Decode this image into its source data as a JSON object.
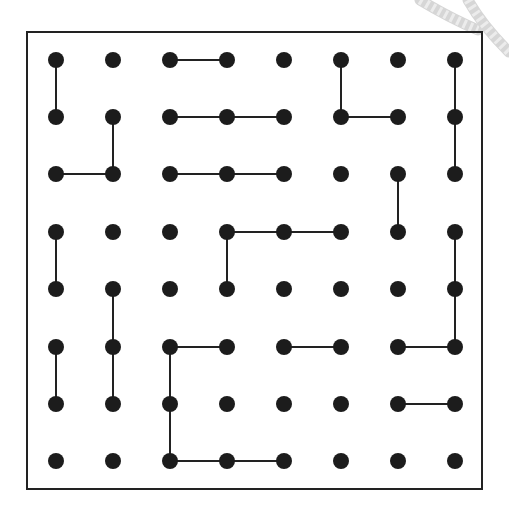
{
  "diagram": {
    "type": "dot-grid-maze",
    "grid": {
      "columns": 8,
      "rows": 8
    },
    "colors": {
      "dot": "#1c1c1c",
      "line": "#222222",
      "frame": "#222222",
      "background": "#ffffff",
      "rope": "#d6d6d6"
    },
    "frame": {
      "x": 27,
      "y": 32,
      "width": 455,
      "height": 457
    },
    "col_x": [
      56,
      113,
      170,
      227,
      284,
      341,
      398,
      455
    ],
    "row_y": [
      60,
      117,
      174,
      232,
      289,
      347,
      404,
      461
    ],
    "edges": [
      [
        [
          0,
          0
        ],
        [
          0,
          1
        ]
      ],
      [
        [
          2,
          0
        ],
        [
          3,
          0
        ]
      ],
      [
        [
          5,
          0
        ],
        [
          5,
          1
        ]
      ],
      [
        [
          5,
          1
        ],
        [
          6,
          1
        ]
      ],
      [
        [
          7,
          0
        ],
        [
          7,
          1
        ]
      ],
      [
        [
          7,
          1
        ],
        [
          7,
          2
        ]
      ],
      [
        [
          1,
          1
        ],
        [
          1,
          2
        ]
      ],
      [
        [
          0,
          2
        ],
        [
          1,
          2
        ]
      ],
      [
        [
          2,
          1
        ],
        [
          3,
          1
        ]
      ],
      [
        [
          3,
          1
        ],
        [
          4,
          1
        ]
      ],
      [
        [
          2,
          2
        ],
        [
          3,
          2
        ]
      ],
      [
        [
          3,
          2
        ],
        [
          4,
          2
        ]
      ],
      [
        [
          6,
          2
        ],
        [
          6,
          3
        ]
      ],
      [
        [
          3,
          3
        ],
        [
          4,
          3
        ]
      ],
      [
        [
          4,
          3
        ],
        [
          5,
          3
        ]
      ],
      [
        [
          3,
          3
        ],
        [
          3,
          4
        ]
      ],
      [
        [
          0,
          3
        ],
        [
          0,
          4
        ]
      ],
      [
        [
          7,
          3
        ],
        [
          7,
          4
        ]
      ],
      [
        [
          7,
          4
        ],
        [
          7,
          5
        ]
      ],
      [
        [
          6,
          5
        ],
        [
          7,
          5
        ]
      ],
      [
        [
          1,
          4
        ],
        [
          1,
          5
        ]
      ],
      [
        [
          1,
          5
        ],
        [
          1,
          6
        ]
      ],
      [
        [
          0,
          5
        ],
        [
          0,
          6
        ]
      ],
      [
        [
          2,
          5
        ],
        [
          3,
          5
        ]
      ],
      [
        [
          2,
          5
        ],
        [
          2,
          6
        ]
      ],
      [
        [
          2,
          6
        ],
        [
          2,
          7
        ]
      ],
      [
        [
          2,
          7
        ],
        [
          3,
          7
        ]
      ],
      [
        [
          3,
          7
        ],
        [
          4,
          7
        ]
      ],
      [
        [
          4,
          5
        ],
        [
          5,
          5
        ]
      ],
      [
        [
          6,
          6
        ],
        [
          7,
          6
        ]
      ]
    ],
    "decoration": {
      "rope_icon": "rope-corner-top-right"
    }
  }
}
